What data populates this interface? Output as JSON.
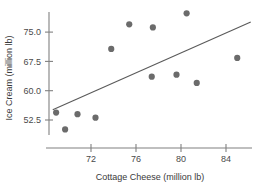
{
  "chart_data": {
    "type": "scatter",
    "title": "",
    "xlabel": "Cottage Cheese (million lb)",
    "ylabel": "Ice Cream (million lb)",
    "xticks": [
      72,
      76,
      80,
      84
    ],
    "yticks": [
      52.5,
      60.0,
      67.5,
      75.0
    ],
    "xlim": [
      68.2,
      86.5
    ],
    "ylim": [
      48.5,
      81.0
    ],
    "grid": false,
    "legend": null,
    "points": [
      {
        "x": 68.9,
        "y": 54.4
      },
      {
        "x": 69.7,
        "y": 50.1
      },
      {
        "x": 70.8,
        "y": 54.0
      },
      {
        "x": 72.4,
        "y": 53.1
      },
      {
        "x": 73.8,
        "y": 70.7
      },
      {
        "x": 75.4,
        "y": 77.0
      },
      {
        "x": 77.4,
        "y": 63.6
      },
      {
        "x": 77.5,
        "y": 76.2
      },
      {
        "x": 79.6,
        "y": 64.1
      },
      {
        "x": 80.5,
        "y": 79.8
      },
      {
        "x": 81.4,
        "y": 62.0
      },
      {
        "x": 85.0,
        "y": 68.4
      }
    ],
    "fit_line": {
      "x1": 68.6,
      "y1": 55.1,
      "x2": 86.2,
      "y2": 77.6
    }
  },
  "axis": {
    "x_tick_labels": [
      "72",
      "76",
      "80",
      "84"
    ],
    "y_tick_labels": [
      "75.0",
      "67.5",
      "60.0",
      "52.5"
    ],
    "x_title": "Cottage Cheese (million lb)",
    "y_title": "Ice Cream (million lb)"
  }
}
